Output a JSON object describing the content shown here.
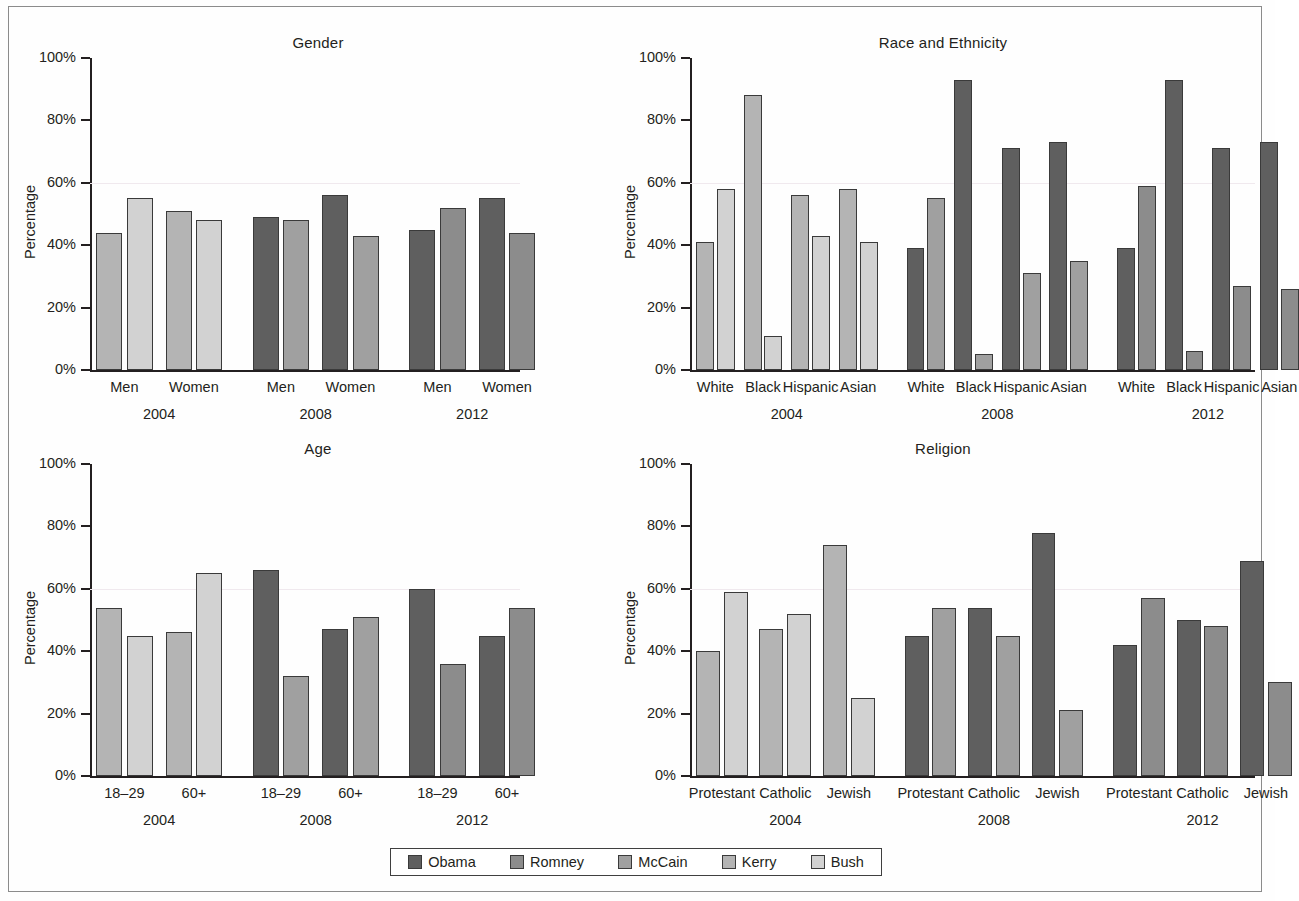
{
  "figure": {
    "y_axis_label": "Percentage",
    "y_ticks": [
      "0%",
      "20%",
      "40%",
      "60%",
      "80%",
      "100%"
    ]
  },
  "legend": {
    "items": [
      {
        "label": "Obama",
        "color": "#5f5f5f"
      },
      {
        "label": "Romney",
        "color": "#8c8c8c"
      },
      {
        "label": "McCain",
        "color": "#a0a0a0"
      },
      {
        "label": "Kerry",
        "color": "#b4b4b4"
      },
      {
        "label": "Bush",
        "color": "#d2d2d2"
      }
    ]
  },
  "chart_data": [
    {
      "type": "bar",
      "title": "Gender",
      "xlabel": "",
      "ylabel": "Percentage",
      "ylim": [
        0,
        100
      ],
      "ytick_labels": [
        "0%",
        "20%",
        "40%",
        "60%",
        "80%",
        "100%"
      ],
      "grid": false,
      "legend_position": "bottom-shared",
      "groups": [
        {
          "year": "2004",
          "categories": [
            "Men",
            "Women"
          ],
          "series": [
            {
              "name": "Kerry",
              "color": "#b4b4b4",
              "values": [
                44,
                51
              ]
            },
            {
              "name": "Bush",
              "color": "#d2d2d2",
              "values": [
                55,
                48
              ]
            }
          ]
        },
        {
          "year": "2008",
          "categories": [
            "Men",
            "Women"
          ],
          "series": [
            {
              "name": "Obama",
              "color": "#5f5f5f",
              "values": [
                49,
                56
              ]
            },
            {
              "name": "McCain",
              "color": "#a0a0a0",
              "values": [
                48,
                43
              ]
            }
          ]
        },
        {
          "year": "2012",
          "categories": [
            "Men",
            "Women"
          ],
          "series": [
            {
              "name": "Obama",
              "color": "#5f5f5f",
              "values": [
                45,
                55
              ]
            },
            {
              "name": "Romney",
              "color": "#8c8c8c",
              "values": [
                52,
                44
              ]
            }
          ]
        }
      ]
    },
    {
      "type": "bar",
      "title": "Race and Ethnicity",
      "xlabel": "",
      "ylabel": "Percentage",
      "ylim": [
        0,
        100
      ],
      "ytick_labels": [
        "0%",
        "20%",
        "40%",
        "60%",
        "80%",
        "100%"
      ],
      "grid": false,
      "legend_position": "bottom-shared",
      "groups": [
        {
          "year": "2004",
          "categories": [
            "White",
            "Black",
            "Hispanic",
            "Asian"
          ],
          "series": [
            {
              "name": "Kerry",
              "color": "#b4b4b4",
              "values": [
                41,
                88,
                56,
                58
              ]
            },
            {
              "name": "Bush",
              "color": "#d2d2d2",
              "values": [
                58,
                11,
                43,
                41
              ]
            }
          ]
        },
        {
          "year": "2008",
          "categories": [
            "White",
            "Black",
            "Hispanic",
            "Asian"
          ],
          "series": [
            {
              "name": "Obama",
              "color": "#5f5f5f",
              "values": [
                39,
                93,
                71,
                73
              ]
            },
            {
              "name": "McCain",
              "color": "#a0a0a0",
              "values": [
                55,
                5,
                31,
                35
              ]
            }
          ]
        },
        {
          "year": "2012",
          "categories": [
            "White",
            "Black",
            "Hispanic",
            "Asian"
          ],
          "series": [
            {
              "name": "Obama",
              "color": "#5f5f5f",
              "values": [
                39,
                93,
                71,
                73
              ]
            },
            {
              "name": "Romney",
              "color": "#8c8c8c",
              "values": [
                59,
                6,
                27,
                26
              ]
            }
          ]
        }
      ]
    },
    {
      "type": "bar",
      "title": "Age",
      "xlabel": "",
      "ylabel": "Percentage",
      "ylim": [
        0,
        100
      ],
      "ytick_labels": [
        "0%",
        "20%",
        "40%",
        "60%",
        "80%",
        "100%"
      ],
      "grid": false,
      "legend_position": "bottom-shared",
      "groups": [
        {
          "year": "2004",
          "categories": [
            "18–29",
            "60+"
          ],
          "series": [
            {
              "name": "Kerry",
              "color": "#b4b4b4",
              "values": [
                54,
                46
              ]
            },
            {
              "name": "Bush",
              "color": "#d2d2d2",
              "values": [
                45,
                65
              ]
            }
          ]
        },
        {
          "year": "2008",
          "categories": [
            "18–29",
            "60+"
          ],
          "series": [
            {
              "name": "Obama",
              "color": "#5f5f5f",
              "values": [
                66,
                47
              ]
            },
            {
              "name": "McCain",
              "color": "#a0a0a0",
              "values": [
                32,
                51
              ]
            }
          ]
        },
        {
          "year": "2012",
          "categories": [
            "18–29",
            "60+"
          ],
          "series": [
            {
              "name": "Obama",
              "color": "#5f5f5f",
              "values": [
                60,
                45
              ]
            },
            {
              "name": "Romney",
              "color": "#8c8c8c",
              "values": [
                36,
                54
              ]
            }
          ]
        }
      ]
    },
    {
      "type": "bar",
      "title": "Religion",
      "xlabel": "",
      "ylabel": "Percentage",
      "ylim": [
        0,
        100
      ],
      "ytick_labels": [
        "0%",
        "20%",
        "40%",
        "60%",
        "80%",
        "100%"
      ],
      "grid": false,
      "legend_position": "bottom-shared",
      "groups": [
        {
          "year": "2004",
          "categories": [
            "Protestant",
            "Catholic",
            "Jewish"
          ],
          "series": [
            {
              "name": "Kerry",
              "color": "#b4b4b4",
              "values": [
                40,
                47,
                74
              ]
            },
            {
              "name": "Bush",
              "color": "#d2d2d2",
              "values": [
                59,
                52,
                25
              ]
            }
          ]
        },
        {
          "year": "2008",
          "categories": [
            "Protestant",
            "Catholic",
            "Jewish"
          ],
          "series": [
            {
              "name": "Obama",
              "color": "#5f5f5f",
              "values": [
                45,
                54,
                78
              ]
            },
            {
              "name": "McCain",
              "color": "#a0a0a0",
              "values": [
                54,
                45,
                21
              ]
            }
          ]
        },
        {
          "year": "2012",
          "categories": [
            "Protestant",
            "Catholic",
            "Jewish"
          ],
          "series": [
            {
              "name": "Obama",
              "color": "#5f5f5f",
              "values": [
                42,
                50,
                69
              ]
            },
            {
              "name": "Romney",
              "color": "#8c8c8c",
              "values": [
                57,
                48,
                30
              ]
            }
          ]
        }
      ]
    }
  ]
}
